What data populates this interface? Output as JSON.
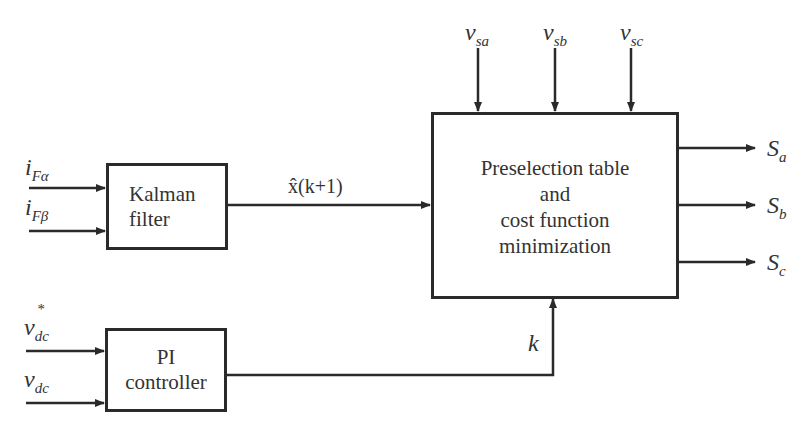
{
  "diagram": {
    "blocks": {
      "kalman": {
        "lines": [
          "Kalman",
          "filter"
        ]
      },
      "pi": {
        "lines": [
          "PI",
          "controller"
        ]
      },
      "main": {
        "lines": [
          "Preselection table",
          "and",
          "cost function",
          "minimization"
        ]
      }
    },
    "inputs": {
      "i_f_alpha": {
        "base": "i",
        "sub": "Fα"
      },
      "i_f_beta": {
        "base": "i",
        "sub": "Fβ"
      },
      "v_dc_ref": {
        "base": "v",
        "sub": "dc",
        "sup": "*"
      },
      "v_dc": {
        "base": "v",
        "sub": "dc"
      },
      "v_sa": {
        "base": "v",
        "sub": "sa"
      },
      "v_sb": {
        "base": "v",
        "sub": "sb"
      },
      "v_sc": {
        "base": "v",
        "sub": "sc"
      }
    },
    "signals": {
      "x_hat": "x̂(k+1)",
      "k": "k"
    },
    "outputs": {
      "s_a": {
        "base": "S",
        "sub": "a"
      },
      "s_b": {
        "base": "S",
        "sub": "b"
      },
      "s_c": {
        "base": "S",
        "sub": "c"
      }
    },
    "colors": {
      "stroke": "#2a2a2a",
      "text": "#333333",
      "background": "#ffffff"
    }
  }
}
